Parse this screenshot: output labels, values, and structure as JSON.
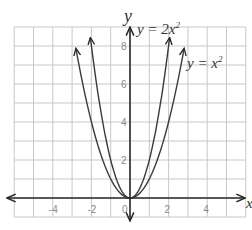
{
  "chart_data": {
    "type": "line",
    "title": "",
    "xlabel": "x",
    "ylabel": "y",
    "xlim": [
      -6,
      6
    ],
    "ylim": [
      -1,
      9
    ],
    "grid": true,
    "x_ticks": [
      -4,
      -2,
      0,
      2,
      4
    ],
    "x_tick_labels": [
      "-4",
      "-2",
      "0",
      "2",
      "4"
    ],
    "y_ticks": [
      2,
      4,
      6,
      8
    ],
    "y_tick_labels": [
      "2",
      "4",
      "6",
      "8"
    ],
    "series": [
      {
        "name": "y = 2x²",
        "label_main": "y = 2x",
        "label_sup": "2",
        "coef": 2,
        "x_range": [
          -2.05,
          2.05
        ],
        "x": [
          -2,
          -1.5,
          -1,
          -0.5,
          0,
          0.5,
          1,
          1.5,
          2
        ],
        "values": [
          8,
          4.5,
          2,
          0.5,
          0,
          0.5,
          2,
          4.5,
          8
        ]
      },
      {
        "name": "y = x²",
        "label_main": "y = x",
        "label_sup": "2",
        "coef": 1,
        "x_range": [
          -2.8,
          2.8
        ],
        "x": [
          -2.8,
          -2,
          -1,
          0,
          1,
          2,
          2.8
        ],
        "values": [
          7.84,
          4,
          1,
          0,
          1,
          4,
          7.84
        ]
      }
    ],
    "annotations": [
      "y = 2x²",
      "y = x²"
    ],
    "colors": {
      "grid": "#c8c8c8",
      "curve": "#3a3a3a",
      "axis": "#2a2a2a",
      "tick": "#8a8a8a"
    }
  }
}
